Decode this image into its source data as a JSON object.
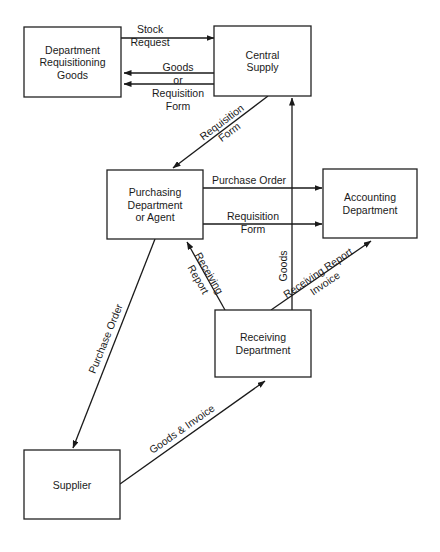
{
  "diagram": {
    "type": "flowchart",
    "colors": {
      "stroke": "#1a1a1a",
      "background": "#ffffff",
      "text": "#1a1a1a"
    },
    "nodes": [
      {
        "id": "dept",
        "lines": [
          "Department",
          "Requisitioning",
          "Goods"
        ],
        "x": 24,
        "y": 27,
        "w": 97,
        "h": 70
      },
      {
        "id": "central",
        "lines": [
          "Central",
          "Supply"
        ],
        "x": 214,
        "y": 26,
        "w": 97,
        "h": 70
      },
      {
        "id": "purchasing",
        "lines": [
          "Purchasing",
          "Department",
          "or Agent"
        ],
        "x": 107,
        "y": 170,
        "w": 96,
        "h": 69
      },
      {
        "id": "accounting",
        "lines": [
          "Accounting",
          "Department"
        ],
        "x": 323,
        "y": 169,
        "w": 94,
        "h": 69
      },
      {
        "id": "receiving",
        "lines": [
          "Receiving",
          "Department"
        ],
        "x": 215,
        "y": 310,
        "w": 96,
        "h": 67
      },
      {
        "id": "supplier",
        "lines": [
          "Supplier"
        ],
        "x": 24,
        "y": 450,
        "w": 96,
        "h": 69
      }
    ],
    "edges": [
      {
        "id": "stock-request",
        "from": "dept",
        "to": "central",
        "x1": 121,
        "y1": 38,
        "x2": 214,
        "y2": 38,
        "label": [
          "Stock",
          "Request"
        ],
        "label_x": 150,
        "label_y": 33,
        "label_rotate": 0
      },
      {
        "id": "goods-to-dept",
        "from": "central",
        "to": "dept",
        "x1": 214,
        "y1": 73,
        "x2": 124,
        "y2": 73,
        "label": [
          "Goods",
          "or"
        ],
        "label_x": 178,
        "label_y": 71,
        "label_rotate": 0
      },
      {
        "id": "reqform-to-dept",
        "from": "central",
        "to": "dept",
        "x1": 214,
        "y1": 84,
        "x2": 124,
        "y2": 84,
        "label": [
          "Requisition",
          "Form"
        ],
        "label_x": 178,
        "label_y": 97,
        "label_rotate": 0
      },
      {
        "id": "reqform-to-purchasing",
        "from": "central",
        "to": "purchasing",
        "x1": 268,
        "y1": 96,
        "x2": 173,
        "y2": 168,
        "label": [
          "Requisition",
          "Form"
        ],
        "label_x": 224,
        "label_y": 125,
        "label_rotate": -37
      },
      {
        "id": "purchase-order-to-accounting",
        "from": "purchasing",
        "to": "accounting",
        "x1": 203,
        "y1": 188,
        "x2": 322,
        "y2": 188,
        "label": [
          "Purchase Order"
        ],
        "label_x": 249,
        "label_y": 184,
        "label_rotate": 0
      },
      {
        "id": "reqform-to-accounting",
        "from": "purchasing",
        "to": "accounting",
        "x1": 203,
        "y1": 224,
        "x2": 322,
        "y2": 224,
        "label": [
          "Requisition",
          "Form"
        ],
        "label_x": 253,
        "label_y": 220,
        "label_rotate": 0
      },
      {
        "id": "receiving-report-to-purchasing",
        "from": "receiving",
        "to": "purchasing",
        "x1": 225,
        "y1": 310,
        "x2": 187,
        "y2": 242,
        "label": [
          "Receiving",
          "Report"
        ],
        "label_x": 206,
        "label_y": 275,
        "label_rotate": 60
      },
      {
        "id": "goods-to-central",
        "from": "receiving",
        "to": "central",
        "x1": 292,
        "y1": 310,
        "x2": 292,
        "y2": 98,
        "label": [
          "Goods"
        ],
        "label_x": 287,
        "label_y": 266,
        "label_rotate": -90
      },
      {
        "id": "receiving-report-invoice-to-accounting",
        "from": "receiving",
        "to": "accounting",
        "x1": 271,
        "y1": 310,
        "x2": 371,
        "y2": 241,
        "label": [
          "Receiving Report",
          "Invoice"
        ],
        "label_x": 320,
        "label_y": 276,
        "label_rotate": -34
      },
      {
        "id": "purchase-order-to-supplier",
        "from": "purchasing",
        "to": "supplier",
        "x1": 155,
        "y1": 239,
        "x2": 73,
        "y2": 448,
        "label": [
          "Purchase Order"
        ],
        "label_x": 109,
        "label_y": 340,
        "label_rotate": -68
      },
      {
        "id": "goods-invoice-to-receiving",
        "from": "supplier",
        "to": "receiving",
        "x1": 120,
        "y1": 484,
        "x2": 265,
        "y2": 381,
        "label": [
          "Goods & Invoice"
        ],
        "label_x": 184,
        "label_y": 432,
        "label_rotate": -35
      }
    ]
  }
}
